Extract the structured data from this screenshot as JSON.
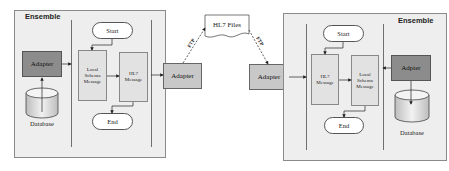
{
  "left_ensemble": {
    "label": "Ensemble",
    "adapter_label": "Adapter",
    "database_label": "Database",
    "start_label": "Start",
    "end_label": "End",
    "first_message": "Local\nSchema\nMessage",
    "second_message": "HL7\nMessage"
  },
  "middle": {
    "left_adapter_label": "Adapter",
    "right_adapter_label": "Adapter",
    "files_label": "HL7  Files",
    "ftp_left_label": "FTP",
    "ftp_right_label": "FTP"
  },
  "right_ensemble": {
    "label": "Ensemble",
    "adapter_label": "Adpter",
    "database_label": "Database",
    "start_label": "Start",
    "end_label": "End",
    "first_message": "HL7\nMessage",
    "second_message": "Local\nSchema\nMessage"
  },
  "colors": {
    "ensemble_bg": "#eeeeee",
    "adapter_dark": "#8c8c8c",
    "adapter_light": "#c8c8c8",
    "message_bg": "#e2e2e2"
  }
}
